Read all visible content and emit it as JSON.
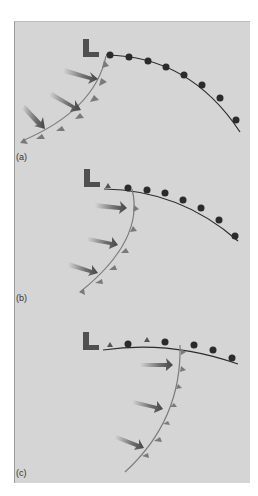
{
  "figure": {
    "panels": [
      {
        "label": "(a)",
        "low_symbol": "L"
      },
      {
        "label": "(b)",
        "low_symbol": "L"
      },
      {
        "label": "(c)",
        "low_symbol": "L"
      }
    ]
  },
  "colors": {
    "background": "#d5d5d5",
    "warm_front": "#2b2b2b",
    "cold_front": "#7a7a7a",
    "low_symbol": "#505050",
    "arrow": "#555555"
  }
}
